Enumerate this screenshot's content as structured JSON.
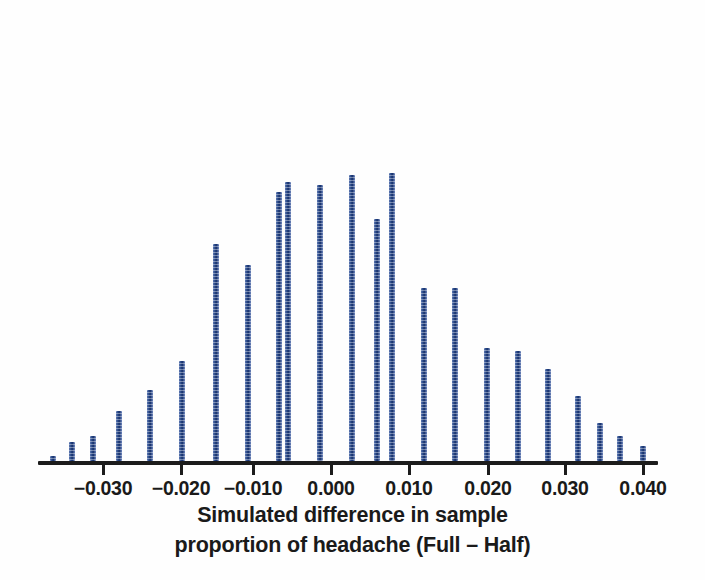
{
  "chart_data": {
    "type": "bar",
    "title": "",
    "subtitle": "",
    "xlabel_line1": "Simulated difference in sample",
    "xlabel_line2": "proportion of headache (Full – Half)",
    "ylabel": "",
    "grid": false,
    "legend": "none",
    "bar_color": "#2d5295",
    "axis_color": "#1c1c1c",
    "background_color": "#fefefe",
    "xlim": [
      -0.038,
      0.042
    ],
    "ylim": [
      0,
      280
    ],
    "xticks": [
      -0.03,
      -0.02,
      -0.01,
      0.0,
      0.01,
      0.02,
      0.03,
      0.04
    ],
    "xtick_labels": [
      "−0.030",
      "−0.020",
      "−0.010",
      "0.000",
      "0.010",
      "0.020",
      "0.030",
      "0.040"
    ],
    "bin_width": 0.004,
    "categories": [
      -0.036,
      -0.032,
      -0.028,
      -0.024,
      -0.02,
      -0.016,
      -0.012,
      -0.008,
      -0.004,
      0.0,
      0.004,
      0.008,
      0.012,
      0.016,
      0.02,
      0.024,
      0.028,
      0.032,
      0.036,
      0.04,
      0.044,
      0.048,
      0.052,
      0.056,
      0.06
    ],
    "values": [
      4,
      18,
      24,
      48,
      68,
      96,
      208,
      188,
      258,
      268,
      265,
      274,
      232,
      166,
      166,
      108,
      105,
      88,
      62,
      36,
      24,
      22,
      14,
      6,
      0
    ],
    "bars": [
      {
        "x_px": 53,
        "value": 4,
        "height_px": 5
      },
      {
        "x_px": 72,
        "value": 18,
        "height_px": 19
      },
      {
        "x_px": 93,
        "value": 24,
        "height_px": 25
      },
      {
        "x_px": 119,
        "value": 48,
        "height_px": 50
      },
      {
        "x_px": 150,
        "value": 68,
        "height_px": 71
      },
      {
        "x_px": 182,
        "value": 96,
        "height_px": 100
      },
      {
        "x_px": 216,
        "value": 208,
        "height_px": 217
      },
      {
        "x_px": 248,
        "value": 188,
        "height_px": 196
      },
      {
        "x_px": 279,
        "value": 258,
        "height_px": 269
      },
      {
        "x_px": 288,
        "value": 268,
        "height_px": 279
      },
      {
        "x_px": 320,
        "value": 265,
        "height_px": 276
      },
      {
        "x_px": 352,
        "value": 274,
        "height_px": 286
      },
      {
        "x_px": 377,
        "value": 232,
        "height_px": 242
      },
      {
        "x_px": 392,
        "value": 276,
        "height_px": 288
      },
      {
        "x_px": 424,
        "value": 166,
        "height_px": 173
      },
      {
        "x_px": 455,
        "value": 166,
        "height_px": 173
      },
      {
        "x_px": 487,
        "value": 108,
        "height_px": 113
      },
      {
        "x_px": 518,
        "value": 105,
        "height_px": 110
      },
      {
        "x_px": 548,
        "value": 88,
        "height_px": 92
      },
      {
        "x_px": 578,
        "value": 62,
        "height_px": 65
      },
      {
        "x_px": 600,
        "value": 36,
        "height_px": 38
      },
      {
        "x_px": 620,
        "value": 24,
        "height_px": 25
      },
      {
        "x_px": 643,
        "value": 14,
        "height_px": 15
      }
    ],
    "annotations": []
  },
  "axis": {
    "baseline_y_px": 461,
    "left_px": 38,
    "right_px": 658,
    "tick_positions_px": [
      103,
      181,
      253,
      331,
      409,
      488,
      565,
      643
    ]
  }
}
